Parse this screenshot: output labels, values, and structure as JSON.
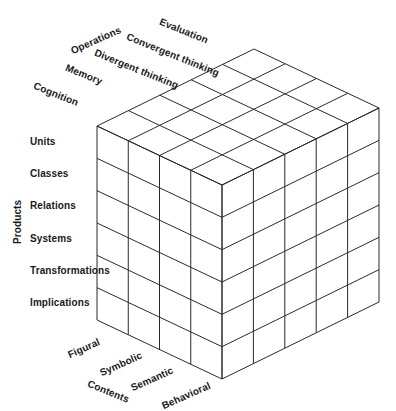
{
  "diagram": {
    "axes": {
      "operations": {
        "label": "Operations",
        "items": [
          "Cognition",
          "Memory",
          "Divergent thinking",
          "Convergent thinking",
          "Evaluation"
        ]
      },
      "products": {
        "label": "Products",
        "items": [
          "Units",
          "Classes",
          "Relations",
          "Systems",
          "Transformations",
          "Implications"
        ]
      },
      "contents": {
        "label": "Contents",
        "items": [
          "Figural",
          "Symbolic",
          "Semantic",
          "Behavioral"
        ]
      }
    },
    "grid": {
      "contents_count": 4,
      "operations_count": 5,
      "products_count": 6
    },
    "colors": {
      "line": "#2a2a2a",
      "text": "#1a1a1a",
      "background": "#ffffff"
    }
  }
}
